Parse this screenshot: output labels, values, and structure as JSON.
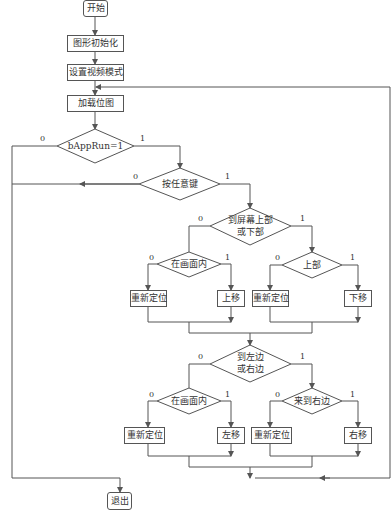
{
  "nodes": {
    "start": "开始",
    "init_graphics": "图形初始化",
    "set_video_mode": "设置视频模式",
    "load_bitmap": "加载位图",
    "cond_apprun": "bAppRun=1",
    "cond_anykey": "按任意键",
    "cond_topbottom_l1": "到屏幕上部",
    "cond_topbottom_l2": "或下部",
    "cond_in_screen_1": "在画面内",
    "cond_top": "上部",
    "reposition_1": "重新定位",
    "move_up": "上移",
    "reposition_2": "重新定位",
    "move_down": "下移",
    "cond_leftright_l1": "到左边",
    "cond_leftright_l2": "或右边",
    "cond_in_screen_2": "在画面内",
    "cond_right": "来到右边",
    "reposition_3": "重新定位",
    "move_left": "左移",
    "reposition_4": "重新定位",
    "move_right": "右移",
    "exit": "退出"
  },
  "branch_labels": {
    "no": "0",
    "yes": "1"
  },
  "colors": {
    "line": "#555555",
    "text": "#333333",
    "background": "#ffffff"
  }
}
